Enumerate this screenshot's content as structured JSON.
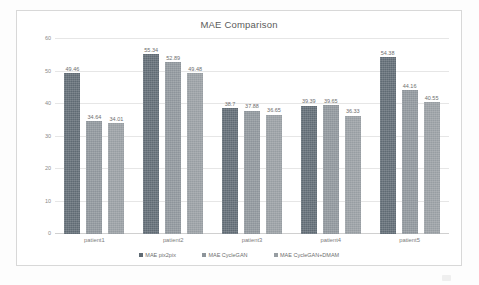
{
  "chart_data": {
    "type": "bar",
    "title": "MAE Comparison",
    "xlabel": "",
    "ylabel": "",
    "ylim": [
      0,
      60
    ],
    "yticks": [
      0,
      10,
      20,
      30,
      40,
      50,
      60
    ],
    "ytick_labels": [
      "0",
      "10",
      "20",
      "30",
      "40",
      "50",
      "60"
    ],
    "grid": true,
    "legend_position": "bottom",
    "categories": [
      "patient1",
      "patient2",
      "patient3",
      "patient4",
      "patient5"
    ],
    "series": [
      {
        "name": "MAE pix2pix",
        "color": "#5f6a73",
        "values": [
          49.46,
          55.34,
          38.7,
          39.39,
          54.38
        ],
        "labels": [
          "49.46",
          "55.34",
          "38.7",
          "39.39",
          "54.38"
        ]
      },
      {
        "name": "MAE CycleGAN",
        "color": "#8d949a",
        "values": [
          34.64,
          52.89,
          37.88,
          39.65,
          44.16
        ],
        "labels": [
          "34.64",
          "52.89",
          "37.88",
          "39.65",
          "44.16"
        ]
      },
      {
        "name": "MAE CycleGAN+DMAM",
        "color": "#979da2",
        "values": [
          34.01,
          49.48,
          36.65,
          36.33,
          40.55
        ],
        "labels": [
          "34.01",
          "49.48",
          "36.65",
          "36.33",
          "40.55"
        ]
      }
    ]
  }
}
